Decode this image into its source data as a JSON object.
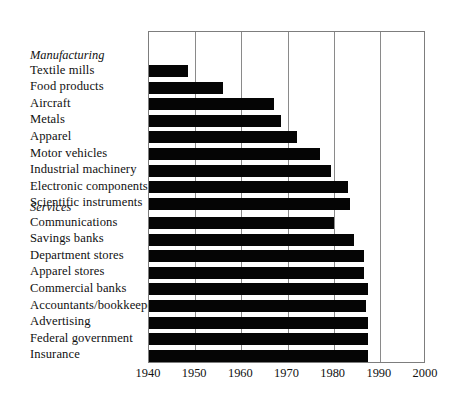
{
  "chart_data": {
    "type": "bar",
    "orientation": "horizontal",
    "title": "",
    "subtitle": "",
    "xlabel": "",
    "ylabel": "",
    "xlim": [
      1940,
      2000
    ],
    "xticks": [
      1940,
      1950,
      1960,
      1970,
      1980,
      1990,
      2000
    ],
    "xtick_labels": [
      "1940",
      "1950",
      "1960",
      "1970",
      "1980",
      "1990",
      "2000"
    ],
    "grid": true,
    "grid_axis": "x",
    "legend": "none",
    "bar_color": "#050505",
    "axis_color": "#7d7d7d",
    "value_meaning": "Year bar ends (bars start at 1940 baseline)",
    "groups": [
      {
        "name": "Manufacturing",
        "categories": [
          "Textile mills",
          "Food products",
          "Aircraft",
          "Metals",
          "Apparel",
          "Motor vehicles",
          "Industrial machinery",
          "Electronic components",
          "Scientific instruments"
        ],
        "values": [
          1948.5,
          1956,
          1967,
          1968.5,
          1972,
          1977,
          1979.5,
          1983,
          1983.5
        ]
      },
      {
        "name": "Services",
        "categories": [
          "Communications",
          "Savings banks",
          "Department stores",
          "Apparel stores",
          "Commercial banks",
          "Accountants/bookkeepers",
          "Advertising",
          "Federal government",
          "Insurance"
        ],
        "values": [
          1980,
          1984.5,
          1986.5,
          1986.5,
          1987.5,
          1987,
          1987.5,
          1987.5,
          1987.5
        ]
      }
    ],
    "categories": [
      "Textile mills",
      "Food products",
      "Aircraft",
      "Metals",
      "Apparel",
      "Motor vehicles",
      "Industrial machinery",
      "Electronic components",
      "Scientific instruments",
      "Communications",
      "Savings banks",
      "Department stores",
      "Apparel stores",
      "Commercial banks",
      "Accountants/bookkeepers",
      "Advertising",
      "Federal government",
      "Insurance"
    ],
    "values": [
      1948.5,
      1956,
      1967,
      1968.5,
      1972,
      1977,
      1979.5,
      1983,
      1983.5,
      1980,
      1984.5,
      1986.5,
      1986.5,
      1987.5,
      1987,
      1987.5,
      1987.5,
      1987.5
    ]
  },
  "layout": {
    "plot_left_px": 148,
    "plot_right_px": 425,
    "plot_top_px": 31,
    "plot_bottom_px": 363,
    "px_per_year": 4.6167,
    "row_pitch_px": 16.6,
    "bar_height_px": 12,
    "group_gap_px": 31,
    "first_row_top_px": 33,
    "services_first_row_top_px": 214
  }
}
